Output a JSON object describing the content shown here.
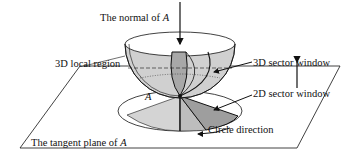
{
  "diagram": {
    "type": "3D geometric illustration",
    "labels": {
      "normal": "The normal of ",
      "normal_var": "A",
      "local_region": "3D local region",
      "sector_3d": "3D sector window",
      "sector_2d": "2D sector window",
      "circle_direction": "Circle direction",
      "tangent_plane": "The tangent plane of ",
      "tangent_plane_var": "A",
      "point": "A"
    },
    "colors": {
      "line": "#111111",
      "shade_light": "#d4d4d4",
      "shade_mid": "#bdbdbd",
      "shade_dark": "#9e9e9e",
      "background": "#ffffff"
    }
  }
}
